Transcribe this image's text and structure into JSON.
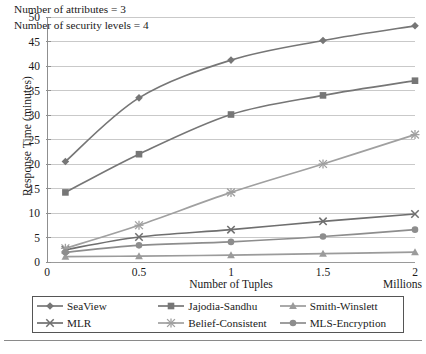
{
  "chart_data": {
    "type": "line",
    "title": "",
    "xlabel": "Number of Tuples",
    "xunits": "Millions",
    "ylabel": "Response Time (minutes)",
    "xlim": [
      0,
      2
    ],
    "ylim": [
      0,
      50
    ],
    "xticks": [
      "0",
      "0.5",
      "1",
      "1.5",
      "2"
    ],
    "xtick_values": [
      0,
      0.5,
      1,
      1.5,
      2
    ],
    "yticks": [
      "0",
      "5",
      "10",
      "15",
      "20",
      "25",
      "30",
      "35",
      "40",
      "45",
      "50"
    ],
    "ytick_values": [
      0,
      5,
      10,
      15,
      20,
      25,
      30,
      35,
      40,
      45,
      50
    ],
    "grid": "horizontal",
    "legend_position": "bottom",
    "x": [
      0.1,
      0.5,
      1,
      1.5,
      2
    ],
    "series": [
      {
        "name": "SeaView",
        "marker": "diamond",
        "color": "#767676",
        "values": [
          20.5,
          33.5,
          41.2,
          45.2,
          48.2
        ]
      },
      {
        "name": "Jajodia-Sandhu",
        "marker": "square",
        "color": "#767676",
        "values": [
          14.2,
          22.0,
          30.1,
          34.0,
          37.0
        ]
      },
      {
        "name": "Smith-Winslett",
        "marker": "triangle",
        "color": "#9b9b9b",
        "values": [
          1.1,
          1.2,
          1.4,
          1.7,
          2.0
        ]
      },
      {
        "name": "MLR",
        "marker": "cross",
        "color": "#6f6f6f",
        "values": [
          2.5,
          5.1,
          6.6,
          8.3,
          9.8
        ]
      },
      {
        "name": "Belief-Consistent",
        "marker": "star",
        "color": "#a0a0a0",
        "values": [
          2.8,
          7.5,
          14.2,
          20.0,
          26.0
        ]
      },
      {
        "name": "MLS-Encryption",
        "marker": "circle",
        "color": "#8d8d8d",
        "values": [
          2.0,
          3.4,
          4.1,
          5.2,
          6.6
        ]
      }
    ],
    "annotations": [
      "Number of attributes = 3",
      "Number of security levels = 4"
    ]
  },
  "legend": {
    "entries": [
      "SeaView",
      "Jajodia-Sandhu",
      "Smith-Winslett",
      "MLR",
      "Belief-Consistent",
      "MLS-Encryption"
    ]
  },
  "footer": {
    "caption": ""
  }
}
